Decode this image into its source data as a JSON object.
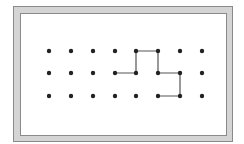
{
  "diagram": {
    "type": "dot-grid-path",
    "grid": {
      "columns": 8,
      "rows": 3,
      "x_positions": [
        49,
        71,
        93,
        115,
        136,
        158,
        180,
        202
      ],
      "y_positions": [
        51,
        73,
        96
      ],
      "dot_radius": 2.2,
      "dot_color": "#222222"
    },
    "path": {
      "points": [
        [
          3,
          1
        ],
        [
          4,
          1
        ],
        [
          4,
          0
        ],
        [
          5,
          0
        ],
        [
          5,
          1
        ],
        [
          6,
          1
        ],
        [
          6,
          2
        ],
        [
          5,
          2
        ]
      ],
      "stroke_color": "#555555",
      "stroke_width": 1.2
    },
    "frame": {
      "fill": "#d4d4d4",
      "edge": "#8a8a8a"
    }
  }
}
